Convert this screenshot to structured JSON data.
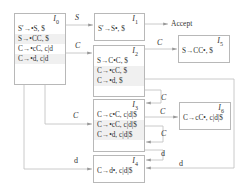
{
  "diagram": {
    "type": "LR(1) item-set automaton",
    "states": [
      {
        "id": "I0",
        "label": "I",
        "sub": "0",
        "items": [
          "S′→•S, $",
          "S→•CC, $",
          "C→•cC, c|d",
          "C→•d, c|d"
        ]
      },
      {
        "id": "I1",
        "label": "I",
        "sub": "1",
        "items": [
          "S′→S•, $"
        ]
      },
      {
        "id": "I2",
        "label": "I",
        "sub": "2",
        "items": [
          "S→C•C, $",
          "C→•cC, $",
          "C→•d, $"
        ]
      },
      {
        "id": "I3",
        "label": "I",
        "sub": "3",
        "items": [
          "C→c•C, c|d|$",
          "C→•cC, c|d|$",
          "C→•d, c|d|$"
        ]
      },
      {
        "id": "I4",
        "label": "I",
        "sub": "4",
        "items": [
          "C→d•, c|d|$"
        ]
      },
      {
        "id": "I5",
        "label": "I",
        "sub": "5",
        "items": [
          "S→CC•, $"
        ]
      },
      {
        "id": "I6",
        "label": "I",
        "sub": "6",
        "items": [
          "C→cC•, c|d|$"
        ]
      }
    ],
    "accept_label": "Accept",
    "edges": [
      {
        "from": "I0",
        "to": "I1",
        "label": "S"
      },
      {
        "from": "I0",
        "to": "I2",
        "label": "C"
      },
      {
        "from": "I0",
        "to": "I3",
        "label": "C"
      },
      {
        "from": "I0",
        "to": "I4",
        "label": "d"
      },
      {
        "from": "I1",
        "to": "Accept",
        "label": ""
      },
      {
        "from": "I2",
        "to": "I5",
        "label": "C"
      },
      {
        "from": "I2",
        "to": "I3",
        "label": "C"
      },
      {
        "from": "I3",
        "to": "I6",
        "label": "C"
      },
      {
        "from": "I3",
        "to": "I3",
        "label": "C"
      },
      {
        "from": "I3",
        "to": "I4",
        "label": "d"
      },
      {
        "from": "I2",
        "to": "I4",
        "label": "d"
      }
    ]
  }
}
